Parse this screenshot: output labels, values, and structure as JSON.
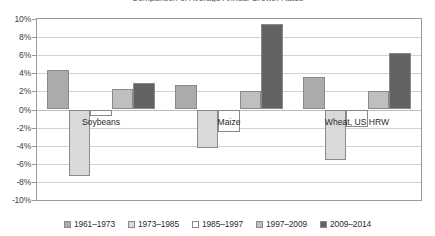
{
  "chart_data": {
    "type": "bar",
    "title": "Comparison of Average Annual Growth Rates",
    "xlabel": "",
    "ylabel": "",
    "ylim": [
      -10,
      10
    ],
    "ytick_step": 2,
    "grid": true,
    "legend_position": "bottom",
    "value_suffix": "%",
    "categories": [
      "Soybeans",
      "Maize",
      "Wheat, US HRW"
    ],
    "ytick_labels": [
      "10%",
      "8%",
      "6%",
      "4%",
      "2%",
      "0%",
      "-2%",
      "-4%",
      "-6%",
      "-8%",
      "-10%"
    ],
    "ytick_values": [
      10,
      8,
      6,
      4,
      2,
      0,
      -2,
      -4,
      -6,
      -8,
      -10
    ],
    "series": [
      {
        "name": "1961–1973",
        "color": "#ABABAB",
        "values": [
          4.4,
          2.7,
          3.6
        ]
      },
      {
        "name": "1973–1985",
        "color": "#D9D9D9",
        "values": [
          -7.4,
          -4.3,
          -5.6
        ]
      },
      {
        "name": "1985–1997",
        "color": "#FFFFFF",
        "values": [
          -0.7,
          -2.5,
          -1.9
        ]
      },
      {
        "name": "1997–2009",
        "color": "#BFBFBF",
        "values": [
          2.3,
          2.0,
          2.0
        ]
      },
      {
        "name": "2009–2014",
        "color": "#636363",
        "values": [
          2.9,
          9.4,
          6.2
        ]
      }
    ]
  }
}
